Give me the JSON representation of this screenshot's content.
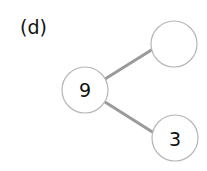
{
  "figure": {
    "label": "(d)"
  },
  "diagram": {
    "type": "number-bond",
    "nodes": [
      {
        "id": "whole",
        "value": "9",
        "role": "whole"
      },
      {
        "id": "part-top",
        "value": "",
        "role": "part (blank)"
      },
      {
        "id": "part-bottom",
        "value": "3",
        "role": "part"
      }
    ],
    "edges": [
      {
        "from": "whole",
        "to": "part-top"
      },
      {
        "from": "whole",
        "to": "part-bottom"
      }
    ],
    "colors": {
      "edge": "#9a9a9a",
      "node_border": "#b5b5b5",
      "text": "#111111"
    }
  }
}
